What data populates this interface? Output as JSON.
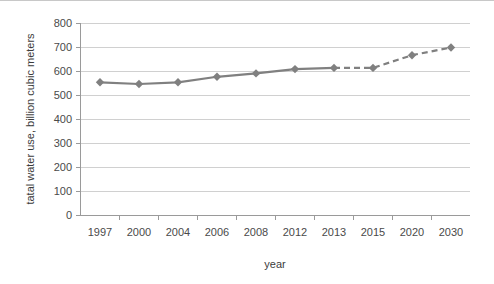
{
  "chart_data": {
    "type": "line",
    "title": "",
    "xlabel": "year",
    "ylabel": "tatal water use, billion cubic meters",
    "categories": [
      "1997",
      "2000",
      "2004",
      "2006",
      "2008",
      "2012",
      "2013",
      "2015",
      "2020",
      "2030"
    ],
    "values": [
      555,
      548,
      555,
      578,
      592,
      610,
      615,
      615,
      668,
      700
    ],
    "series": [
      {
        "name": "total water use",
        "values": [
          555,
          548,
          555,
          578,
          592,
          610,
          615,
          615,
          668,
          700
        ],
        "segments": [
          {
            "style": "solid",
            "from_index": 0,
            "to_index": 6
          },
          {
            "style": "dashed",
            "from_index": 6,
            "to_index": 9
          }
        ]
      }
    ],
    "ylim": [
      0,
      800
    ],
    "yticks": [
      0,
      100,
      200,
      300,
      400,
      500,
      600,
      700,
      800
    ],
    "ytick_labels": [
      "0",
      "100",
      "200",
      "300",
      "400",
      "500",
      "600",
      "700",
      "800"
    ],
    "xtick_labels": [
      "1997",
      "2000",
      "2004",
      "2006",
      "2008",
      "2012",
      "2013",
      "2015",
      "2020",
      "2030"
    ],
    "grid": true,
    "grid_axis": "y",
    "legend": false,
    "legend_position": "none",
    "marker": "diamond",
    "colors": {
      "line": "#808080",
      "marker": "#808080",
      "gridline": "#d0d0d0",
      "axis": "#9a9a9a",
      "text": "#4a4a4a",
      "background": "#ffffff"
    }
  }
}
